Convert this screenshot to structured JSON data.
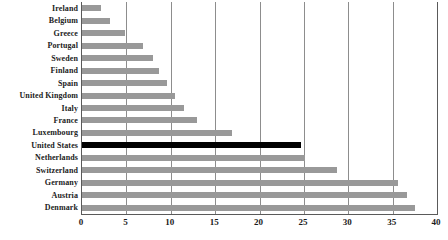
{
  "chart_data": {
    "type": "bar",
    "orientation": "horizontal",
    "title": "",
    "xlabel": "",
    "ylabel": "",
    "xlim": [
      0,
      40
    ],
    "ylim": null,
    "grid": true,
    "legend": null,
    "xticks": [
      0,
      5,
      10,
      15,
      20,
      25,
      30,
      35,
      40
    ],
    "xtick_labels": [
      "0",
      "5",
      "10",
      "15",
      "20",
      "25",
      "30",
      "35",
      "40"
    ],
    "categories": [
      "Ireland",
      "Belgium",
      "Greece",
      "Portugal",
      "Sweden",
      "Finland",
      "Spain",
      "United Kingdom",
      "Italy",
      "France",
      "Luxembourg",
      "United States",
      "Netherlands",
      "Switzerland",
      "Germany",
      "Austria",
      "Denmark"
    ],
    "values": [
      2.1,
      3.2,
      4.8,
      6.9,
      8.0,
      8.7,
      9.6,
      10.5,
      11.5,
      13.0,
      16.9,
      24.7,
      25.1,
      28.7,
      35.6,
      36.6,
      37.5
    ],
    "highlight_category": "United States",
    "colors": {
      "bar": "#999999",
      "highlight_bar": "#000000",
      "gridline": "#8d8d8d",
      "axis": "#5a5a5a",
      "label_text": "#222222",
      "background": "#ffffff"
    }
  }
}
